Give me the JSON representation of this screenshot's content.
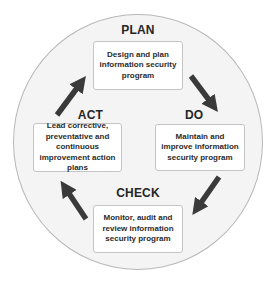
{
  "diagram": {
    "type": "cycle",
    "colors": {
      "circle_fill": "#f4f4f4",
      "circle_border": "#b8b8b8",
      "box_fill": "#ffffff",
      "box_border": "#c4c4c4",
      "arrow": "#3a3a3a",
      "text": "#262626"
    },
    "phases": {
      "plan": {
        "label": "PLAN",
        "description": "Design and plan information security program"
      },
      "do": {
        "label": "DO",
        "description": "Maintain and improve information security program"
      },
      "check": {
        "label": "CHECK",
        "description": "Monitor, audit and review information security program"
      },
      "act": {
        "label": "ACT",
        "description": "Lead corrective, preventative and continuous improvement action plans"
      }
    },
    "arrows": [
      {
        "from": "plan",
        "to": "do",
        "icon": "arrow-down-right-icon"
      },
      {
        "from": "do",
        "to": "check",
        "icon": "arrow-down-left-icon"
      },
      {
        "from": "check",
        "to": "act",
        "icon": "arrow-up-left-icon"
      },
      {
        "from": "act",
        "to": "plan",
        "icon": "arrow-up-right-icon"
      }
    ]
  }
}
